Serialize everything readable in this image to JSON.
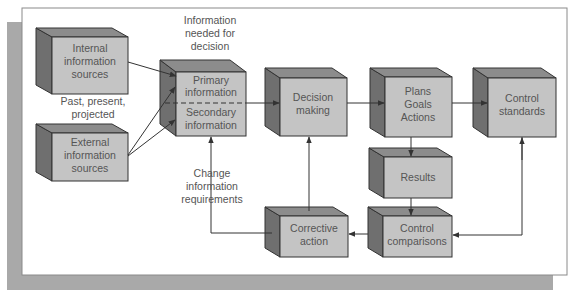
{
  "colors": {
    "shadow": "#a9a9a9",
    "frame_bg": "#ffffff",
    "frame_border": "#8a8a8a",
    "box_front": "#c4c4c4",
    "box_top": "#8c8c8c",
    "box_side": "#6f6f6f",
    "box_edge": "#333333",
    "line": "#333333",
    "text": "#555555"
  },
  "boxes": {
    "internal": {
      "lines": [
        "Internal",
        "information",
        "sources"
      ]
    },
    "external": {
      "lines": [
        "External",
        "information",
        "sources"
      ]
    },
    "info": {
      "primary_lines": [
        "Primary",
        "information"
      ],
      "secondary_lines": [
        "Secondary",
        "information"
      ]
    },
    "decision": {
      "lines": [
        "Decision",
        "making"
      ]
    },
    "plans": {
      "lines": [
        "Plans",
        "Goals",
        "Actions"
      ]
    },
    "standards": {
      "lines": [
        "Control",
        "standards"
      ]
    },
    "results": {
      "lines": [
        "Results"
      ]
    },
    "comparisons": {
      "lines": [
        "Control",
        "comparisons"
      ]
    },
    "corrective": {
      "lines": [
        "Corrective",
        "action"
      ]
    }
  },
  "labels": {
    "info_needed": [
      "Information",
      "needed for",
      "decision"
    ],
    "timeframe": [
      "Past, present,",
      "projected"
    ],
    "change_req": [
      "Change",
      "information",
      "requirements"
    ]
  }
}
